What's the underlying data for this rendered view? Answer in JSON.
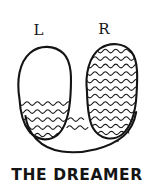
{
  "figure": {
    "title": "THE DREAMER",
    "caption": "THE DREAMER",
    "style": "hand-drawn ink sketch",
    "ink_color": "#141414",
    "background_color": "#ffffff",
    "labels": {
      "left": "L",
      "right": "R"
    },
    "shapes": {
      "left_lobe": {
        "name": "left-lobe",
        "label": "L",
        "fill_pattern": "squiggle-hatch",
        "fill_coverage": "lower-third",
        "hatch_rows": 5
      },
      "right_lobe": {
        "name": "right-lobe",
        "label": "R",
        "fill_pattern": "squiggle-hatch",
        "fill_coverage": "full",
        "hatch_rows": 11
      },
      "connector": {
        "name": "u-connector",
        "fill_pattern": "squiggle-hatch",
        "hatch_rows": 1
      }
    }
  }
}
